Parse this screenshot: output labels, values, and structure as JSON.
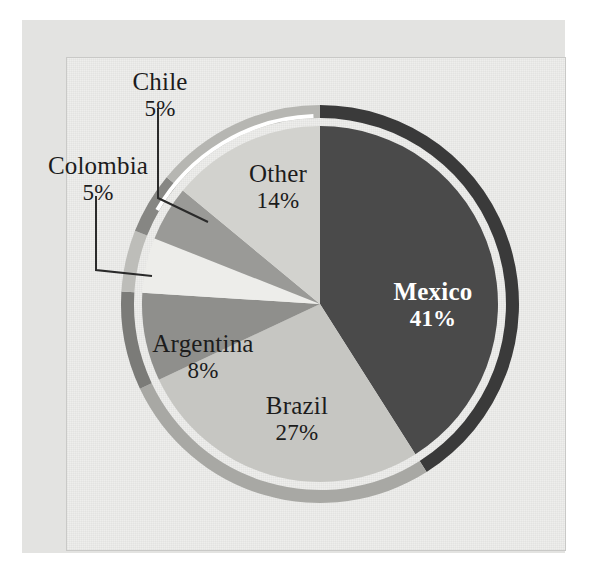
{
  "chart_data": {
    "type": "pie",
    "title": "",
    "subtitle": "",
    "xlabel": "",
    "ylabel": "",
    "legend_position": "none",
    "grid": false,
    "units": "percent",
    "start_angle_deg": 0,
    "direction": "clockwise",
    "categories": [
      "Mexico",
      "Brazil",
      "Argentina",
      "Colombia",
      "Chile",
      "Other"
    ],
    "values": [
      41,
      27,
      8,
      5,
      5,
      14
    ],
    "slices": [
      {
        "label": "Mexico",
        "value": 41,
        "value_text": "41%",
        "color": "#4a4a4a",
        "rim_color": "#3a3a3a",
        "label_placement": "inside",
        "label_color": "#ffffff",
        "label_bold": true,
        "start_deg": 0,
        "end_deg": 147.6,
        "exploded": false
      },
      {
        "label": "Brazil",
        "value": 27,
        "value_text": "27%",
        "color": "#c6c6c2",
        "rim_color": "#a8a8a4",
        "label_placement": "inside",
        "label_color": "#1c1c1c",
        "label_bold": false,
        "start_deg": 147.6,
        "end_deg": 244.8,
        "exploded": false
      },
      {
        "label": "Argentina",
        "value": 8,
        "value_text": "8%",
        "color": "#8f8f8c",
        "rim_color": "#7b7b78",
        "label_placement": "inside",
        "label_color": "#1c1c1c",
        "label_bold": false,
        "start_deg": 244.8,
        "end_deg": 273.6,
        "exploded": false
      },
      {
        "label": "Colombia",
        "value": 5,
        "value_text": "5%",
        "color": "#ededea",
        "rim_color": "#bdbdb9",
        "label_placement": "outside-leader",
        "label_color": "#1c1c1c",
        "label_bold": false,
        "start_deg": 273.6,
        "end_deg": 291.6,
        "exploded": false
      },
      {
        "label": "Chile",
        "value": 5,
        "value_text": "5%",
        "color": "#9a9a97",
        "rim_color": "#868683",
        "label_placement": "outside-leader",
        "label_color": "#1c1c1c",
        "label_bold": false,
        "start_deg": 291.6,
        "end_deg": 309.6,
        "exploded": false
      },
      {
        "label": "Other",
        "value": 14,
        "value_text": "14%",
        "color": "#d2d2ce",
        "rim_color": "#b6b6b2",
        "label_placement": "inside",
        "label_color": "#1c1c1c",
        "label_bold": false,
        "start_deg": 309.6,
        "end_deg": 360,
        "exploded": false
      }
    ]
  },
  "labels": {
    "mexico": {
      "name": "Mexico",
      "pct": "41%"
    },
    "brazil": {
      "name": "Brazil",
      "pct": "27%"
    },
    "argentina": {
      "name": "Argentina",
      "pct": "8%"
    },
    "other": {
      "name": "Other",
      "pct": "14%"
    },
    "chile": {
      "name": "Chile",
      "pct": "5%"
    },
    "colombia": {
      "name": "Colombia",
      "pct": "5%"
    }
  },
  "colors": {
    "page_background": "#ffffff",
    "card_background": "#e3e3e1",
    "plot_background": "#eeeeec",
    "frame_border": "#c9c9c7",
    "text": "#1c1c1c",
    "leader_line": "#2a2a2a"
  }
}
